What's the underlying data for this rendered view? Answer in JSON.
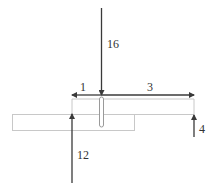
{
  "diagram": {
    "type": "force-diagram",
    "colors": {
      "force_line": "#3a3a3a",
      "outline": "#c8c8c8",
      "label": "#333333"
    },
    "forces": [
      {
        "id": "top-force",
        "label": "16",
        "direction": "down"
      },
      {
        "id": "left-distance",
        "label": "1",
        "direction": "left"
      },
      {
        "id": "right-distance",
        "label": "3",
        "direction": "right"
      },
      {
        "id": "bottom-left-force",
        "label": "12",
        "direction": "up"
      },
      {
        "id": "right-force",
        "label": "4",
        "direction": "up"
      }
    ]
  }
}
